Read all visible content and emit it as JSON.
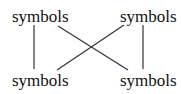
{
  "diagram": {
    "type": "bipartite-connection",
    "nodes": [
      {
        "id": "top-left",
        "label": "symbols",
        "x": 12,
        "y": 8
      },
      {
        "id": "top-right",
        "label": "symbols",
        "x": 120,
        "y": 8
      },
      {
        "id": "bottom-left",
        "label": "symbols",
        "x": 12,
        "y": 72
      },
      {
        "id": "bottom-right",
        "label": "symbols",
        "x": 120,
        "y": 72
      }
    ],
    "edges": [
      {
        "from": "top-left",
        "to": "bottom-left"
      },
      {
        "from": "top-right",
        "to": "bottom-right"
      },
      {
        "from": "top-left",
        "to": "bottom-right"
      },
      {
        "from": "top-right",
        "to": "bottom-left"
      }
    ],
    "line_color": "#333333"
  }
}
